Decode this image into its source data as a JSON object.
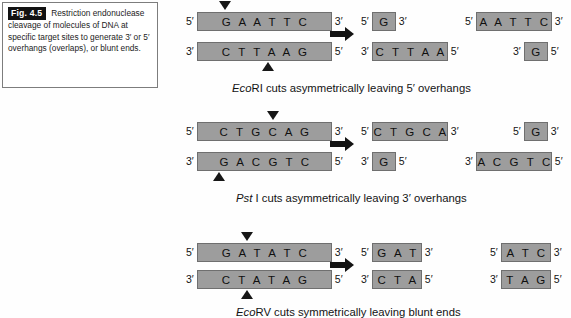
{
  "caption": {
    "fig_label": "Fig. 4.5",
    "text": "Restriction endonuclease cleavage of molecules of DNA at specific target sites to generate 3′ or 5′ overhangs (overlaps), or blunt ends."
  },
  "labels": {
    "five_prime": "5′",
    "three_prime": "3′"
  },
  "panels": [
    {
      "id": "ecori",
      "substrate": {
        "top": {
          "left_end": "5′",
          "sequence": "G A A T T C",
          "right_end": "3′"
        },
        "bottom": {
          "left_end": "3′",
          "sequence": "C T T A A G",
          "right_end": "5′"
        }
      },
      "products_left": {
        "top": {
          "left_end": "5′",
          "sequence": "G",
          "right_end": "3′"
        },
        "bottom": {
          "left_end": "3′",
          "sequence": "C T T A A",
          "right_end": "5′"
        }
      },
      "products_right": {
        "top": {
          "left_end": "5′",
          "sequence": "A A T T C",
          "right_end": "3′"
        },
        "bottom": {
          "left_end": "3′",
          "sequence": "G",
          "right_end": "5′"
        }
      },
      "caption_italic": "Eco",
      "caption_rest": "RI cuts asymmetrically leaving 5′ overhangs"
    },
    {
      "id": "psti",
      "substrate": {
        "top": {
          "left_end": "5′",
          "sequence": "C T G C A G",
          "right_end": "3′"
        },
        "bottom": {
          "left_end": "3′",
          "sequence": "G A C G T C",
          "right_end": "5′"
        }
      },
      "products_left": {
        "top": {
          "left_end": "5′",
          "sequence": "C T G C A",
          "right_end": "3′"
        },
        "bottom": {
          "left_end": "3′",
          "sequence": "G",
          "right_end": "5′"
        }
      },
      "products_right": {
        "top": {
          "left_end": "5′",
          "sequence": "G",
          "right_end": "3′"
        },
        "bottom": {
          "left_end": "3′",
          "sequence": "A C G T C",
          "right_end": "5′"
        }
      },
      "caption_italic": "Pst",
      "caption_rest": " I cuts asymmetrically leaving 3′ overhangs"
    },
    {
      "id": "ecorv",
      "substrate": {
        "top": {
          "left_end": "5′",
          "sequence": "G A T A T C",
          "right_end": "3′"
        },
        "bottom": {
          "left_end": "3′",
          "sequence": "C T A T A G",
          "right_end": "5′"
        }
      },
      "products_left": {
        "top": {
          "left_end": "5′",
          "sequence": "G A T",
          "right_end": "3′"
        },
        "bottom": {
          "left_end": "3′",
          "sequence": "C T A",
          "right_end": "5′"
        }
      },
      "products_right": {
        "top": {
          "left_end": "5′",
          "sequence": "A T C",
          "right_end": "3′"
        },
        "bottom": {
          "left_end": "3′",
          "sequence": "T A G",
          "right_end": "5′"
        }
      },
      "caption_italic": "Eco",
      "caption_rest": "RV cuts symmetrically leaving blunt ends"
    }
  ]
}
